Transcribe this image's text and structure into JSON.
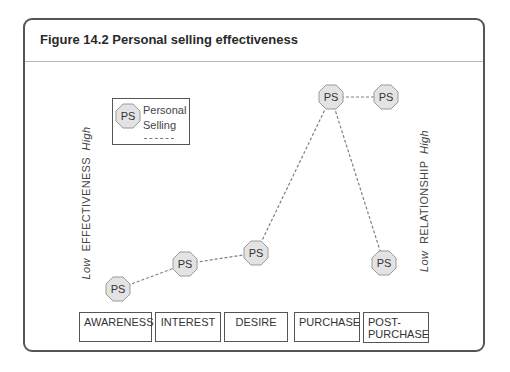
{
  "figure": {
    "title": "Figure 14.2 Personal selling effectiveness"
  },
  "legend": {
    "icon_label": "PS",
    "text_line1": "Personal",
    "text_line2": "Selling",
    "line_style": "dashed"
  },
  "axes": {
    "left": {
      "low": "Low",
      "label": "EFFECTIVENESS",
      "high": "High"
    },
    "right": {
      "low": "Low",
      "label": "RELATIONSHIP",
      "high": "High"
    }
  },
  "stages": [
    {
      "label": "AWARENESS"
    },
    {
      "label": "INTEREST"
    },
    {
      "label": "DESIRE"
    },
    {
      "label": "PURCHASE"
    },
    {
      "label": "POST-\nPURCHASE",
      "line1": "POST-",
      "line2": "PURCHASE"
    }
  ],
  "nodes": [
    {
      "label": "PS",
      "stage": "AWARENESS",
      "level": "low"
    },
    {
      "label": "PS",
      "stage": "INTEREST",
      "level": "low-medium"
    },
    {
      "label": "PS",
      "stage": "DESIRE",
      "level": "medium-low"
    },
    {
      "label": "PS",
      "stage": "PURCHASE",
      "level": "high"
    },
    {
      "label": "PS",
      "stage": "POST-PURCHASE (relationship)",
      "level": "high"
    },
    {
      "label": "PS",
      "stage": "POST-PURCHASE (effectiveness)",
      "level": "low"
    }
  ],
  "colors": {
    "frame": "#555555",
    "node_fill": "#e3e3e3",
    "node_stroke": "#9a9a9a",
    "dash": "#808080",
    "text": "#333333"
  }
}
